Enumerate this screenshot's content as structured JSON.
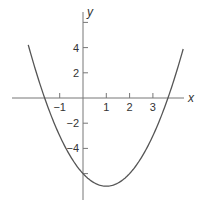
{
  "chart_data": {
    "type": "line",
    "title": "",
    "xlabel": "x",
    "ylabel": "y",
    "function": "y = (x - 1)^2 - 7",
    "xlim": [
      -3.6,
      4.9
    ],
    "ylim": [
      -7.2,
      7.8
    ],
    "x_ticks": [
      -1,
      1,
      2,
      3
    ],
    "x_tick_labels": [
      "−1",
      "1",
      "2",
      "3"
    ],
    "y_ticks": [
      -6,
      -4,
      -2,
      2,
      4,
      6
    ],
    "y_tick_labels": [
      "",
      "−4",
      "−2",
      "2",
      "4",
      ""
    ],
    "grid": false,
    "legend": null,
    "series": [
      {
        "name": "parabola",
        "x": [
          -2.4,
          -2.0,
          -1.65,
          -1.0,
          0,
          1,
          2,
          3,
          3.65,
          4.0,
          4.4
        ],
        "y": [
          4.56,
          2.0,
          0.0,
          -3.0,
          -6.0,
          -7.0,
          -6.0,
          -3.0,
          0.0,
          2.0,
          4.56
        ]
      }
    ],
    "annotations": {
      "vertex": [
        1,
        -7
      ],
      "x_intercepts": [
        -1.65,
        3.65
      ],
      "y_intercept": -6
    }
  },
  "colors": {
    "curve": "#555555",
    "axes": "#777777",
    "text": "#333333"
  }
}
